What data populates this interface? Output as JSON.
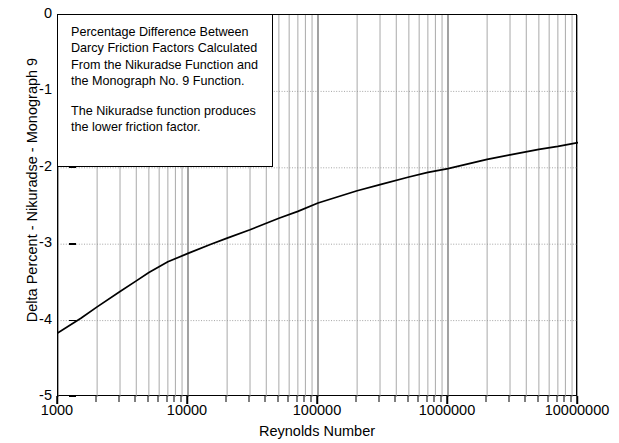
{
  "chart_data": {
    "type": "line",
    "title": "",
    "xlabel": "Reynolds Number",
    "ylabel": "Delta Percent - Nikuradse - Monograph 9",
    "xscale": "log",
    "yscale": "linear",
    "xlim": [
      1000,
      10000000
    ],
    "ylim": [
      -5,
      0
    ],
    "grid": true,
    "legend": null,
    "x_tick_labels": [
      "1000",
      "10000",
      "100000",
      "1000000",
      "10000000"
    ],
    "x_tick_values": [
      1000,
      10000,
      100000,
      1000000,
      10000000
    ],
    "y_tick_labels": [
      "0",
      "-1",
      "-2",
      "-3",
      "-4",
      "-5"
    ],
    "y_tick_values": [
      0,
      -1,
      -2,
      -3,
      -4,
      -5
    ],
    "series": [
      {
        "name": "Delta Percent",
        "x": [
          1000,
          1500,
          2000,
          3000,
          4000,
          5000,
          7000,
          10000,
          15000,
          20000,
          30000,
          50000,
          70000,
          100000,
          200000,
          300000,
          500000,
          700000,
          1000000,
          2000000,
          3000000,
          5000000,
          7000000,
          10000000
        ],
        "values": [
          -4.16,
          -3.97,
          -3.82,
          -3.62,
          -3.48,
          -3.37,
          -3.23,
          -3.12,
          -3.0,
          -2.92,
          -2.81,
          -2.66,
          -2.57,
          -2.46,
          -2.3,
          -2.22,
          -2.12,
          -2.06,
          -2.01,
          -1.89,
          -1.83,
          -1.76,
          -1.72,
          -1.67
        ]
      }
    ],
    "annotation": {
      "lines": [
        "Percentage Difference Between",
        "Darcy Friction Factors Calculated",
        "From the Nikuradse Function and",
        "the Monograph No. 9 Function."
      ],
      "lines2": [
        "The Nikuradse function produces",
        "the lower friction factor."
      ]
    },
    "colors": {
      "curve": "#000000",
      "axis": "#000000",
      "grid": "#9a9a9a",
      "background": "#ffffff"
    }
  },
  "axes": {
    "y_title": "Delta Percent - Nikuradse - Monograph 9",
    "x_title": "Reynolds Number",
    "y_labels": [
      "0",
      "-1",
      "-2",
      "-3",
      "-4",
      "-5"
    ],
    "x_labels": [
      "1000",
      "10000",
      "100000",
      "1000000",
      "10000000"
    ]
  },
  "annotation": {
    "l0": "Percentage Difference Between",
    "l1": "Darcy Friction Factors Calculated",
    "l2": "From the Nikuradse Function and",
    "l3": "the Monograph No. 9 Function.",
    "l4": "The Nikuradse function produces",
    "l5": "the lower friction factor."
  }
}
